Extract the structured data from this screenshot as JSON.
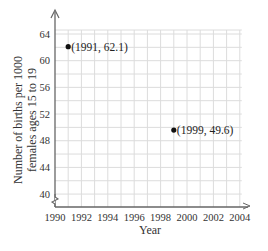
{
  "chart_data": {
    "type": "scatter",
    "title": "",
    "xlabel": "Year",
    "ylabel_lines": [
      "Number of births per 1000",
      "females ages 15 to 19"
    ],
    "ylabel": "Number of births per 1000 females ages 15 to 19",
    "x_ticks": [
      1990,
      1992,
      1994,
      1996,
      1998,
      2000,
      2002,
      2004
    ],
    "y_ticks": [
      40,
      44,
      48,
      52,
      56,
      60,
      64
    ],
    "xlim": [
      1990,
      2004
    ],
    "ylim": [
      38,
      64.5
    ],
    "grid": true,
    "y_axis_break": true,
    "points": [
      {
        "x": 1991,
        "y": 62.1,
        "label": "(1991, 62.1)"
      },
      {
        "x": 1999,
        "y": 49.6,
        "label": "(1999, 49.6)"
      }
    ],
    "colors": {
      "grid": "#dcdcdc",
      "axis": "#555555",
      "point": "#111111"
    }
  }
}
